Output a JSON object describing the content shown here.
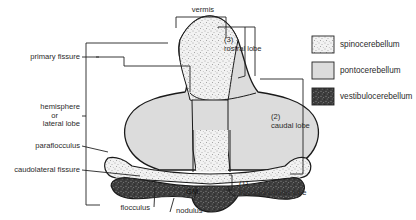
{
  "figure": {
    "labels": {
      "vermis": "vermis",
      "primary_fissure": "primary fissure",
      "hemisphere_l1": "hemisphere",
      "hemisphere_l2": "or",
      "hemisphere_l3": "lateral lobe",
      "paraflocculus": "paraflocculus",
      "caudolateral_fissure": "caudolateral fissure",
      "flocculus": "flocculus",
      "nodulus": "nodulus",
      "gm": "GM.",
      "rostral_num": "(3)",
      "rostral": "rostral lobe",
      "caudal_num": "(2)",
      "caudal": "caudal lobe",
      "floc_num": "(1)",
      "floc": "flocculonodular lobe"
    },
    "legend": [
      {
        "label": "spinocerebellum",
        "pattern": "light-stipple"
      },
      {
        "label": "pontocerebellum",
        "pattern": "solid-grey"
      },
      {
        "label": "vestibulocerebellum",
        "pattern": "dark-stipple"
      }
    ],
    "colors": {
      "outline": "#1a1a1a",
      "ponto": "#dcdcdc",
      "spino_bg": "#f1f1f1",
      "vestibulo_bg": "#3a3a3a"
    }
  }
}
